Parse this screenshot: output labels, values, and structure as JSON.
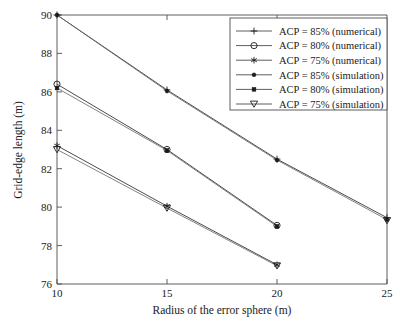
{
  "chart_data": {
    "type": "line",
    "title": "",
    "xlabel": "Radius of the error sphere (m)",
    "ylabel": "Grid-edge length (m)",
    "xlim": [
      10,
      25
    ],
    "ylim": [
      76,
      90
    ],
    "xticks": [
      10,
      15,
      20,
      25
    ],
    "yticks": [
      76,
      78,
      80,
      82,
      84,
      86,
      88,
      90
    ],
    "xtick_labels": [
      "10",
      "15",
      "20",
      "25"
    ],
    "ytick_labels": [
      "76",
      "78",
      "80",
      "82",
      "84",
      "86",
      "88",
      "90"
    ],
    "grid": false,
    "legend_position": "top-right",
    "series": [
      {
        "name": "ACP = 85% (numerical)",
        "marker": "plus",
        "x": [
          10,
          15,
          20,
          25
        ],
        "values": [
          90.0,
          86.1,
          82.5,
          79.45
        ]
      },
      {
        "name": "ACP = 80% (numerical)",
        "marker": "circle",
        "x": [
          10,
          15,
          20
        ],
        "values": [
          86.4,
          83.0,
          79.05
        ]
      },
      {
        "name": "ACP = 75% (numerical)",
        "marker": "asterisk",
        "x": [
          10,
          15,
          20
        ],
        "values": [
          83.2,
          80.05,
          77.0
        ]
      },
      {
        "name": "ACP = 85% (simulation)",
        "marker": "dot-filled",
        "x": [
          10,
          15,
          20,
          25
        ],
        "values": [
          90.0,
          86.05,
          82.45,
          79.35
        ]
      },
      {
        "name": "ACP = 80% (simulation)",
        "marker": "square-filled",
        "x": [
          10,
          15,
          20
        ],
        "values": [
          86.2,
          82.95,
          79.0
        ]
      },
      {
        "name": "ACP = 75% (simulation)",
        "marker": "triangle-down",
        "x": [
          10,
          15,
          20,
          25
        ],
        "values": [
          83.0,
          79.95,
          76.95,
          79.3
        ]
      }
    ],
    "legend_entries": [
      "ACP = 85% (numerical)",
      "ACP = 80% (numerical)",
      "ACP = 75% (numerical)",
      "ACP = 85% (simulation)",
      "ACP = 80% (simulation)",
      "ACP = 75% (simulation)"
    ],
    "colors": {
      "line": "#2b2b2b",
      "line_light": "#6b6b6b",
      "axis": "#4d4d4d",
      "text": "#1a1a1a",
      "background": "#ffffff"
    }
  }
}
